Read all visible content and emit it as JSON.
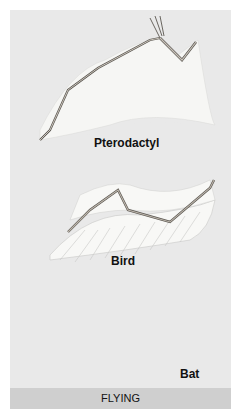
{
  "figure": {
    "panels": [
      {
        "label": "Pterodactyl"
      },
      {
        "label": "Bird"
      },
      {
        "label": "Bat"
      }
    ],
    "category_label": "FLYING"
  },
  "colors": {
    "background": "#e9e9e9",
    "membrane": "#f6f6f4",
    "bone": "#b9b2a8",
    "bone_outline": "#5a5650",
    "band": "#cfcfcf"
  }
}
